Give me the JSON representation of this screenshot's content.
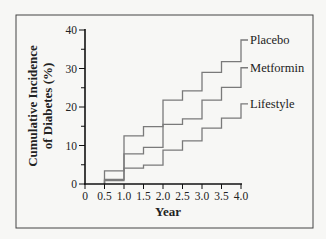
{
  "chart_data": {
    "type": "line",
    "subtype": "step",
    "title": "",
    "xlabel": "Year",
    "ylabel": "Cumulative Incidence of Diabetes (%)",
    "ylabel_lines": [
      "Cumulative Incidence",
      "of Diabetes (%)"
    ],
    "xlim": [
      0,
      4.0
    ],
    "ylim": [
      0,
      40
    ],
    "x_ticks": [
      0,
      0.5,
      1.0,
      1.5,
      2.0,
      2.5,
      3.0,
      3.5,
      4.0
    ],
    "x_tick_labels": [
      "0",
      "0.5",
      "1.0",
      "1.5",
      "2.0",
      "2.5",
      "3.0",
      "3.5",
      "4.0"
    ],
    "y_ticks": [
      0,
      10,
      20,
      30,
      40
    ],
    "y_tick_labels": [
      "0",
      "10",
      "20",
      "30",
      "40"
    ],
    "y_minor_ticks": [
      5,
      15,
      25,
      35
    ],
    "grid": false,
    "legend_position": "inline-right",
    "x": [
      0.5,
      1.0,
      1.5,
      2.0,
      2.5,
      3.0,
      3.5,
      4.0
    ],
    "series": [
      {
        "name": "Placebo",
        "values": [
          3.4,
          12.5,
          14.9,
          21.8,
          24.2,
          29.0,
          31.8,
          37.4
        ]
      },
      {
        "name": "Metformin",
        "values": [
          1.2,
          7.8,
          9.5,
          15.5,
          16.9,
          21.8,
          25.1,
          30.2
        ]
      },
      {
        "name": "Lifestyle",
        "values": [
          0.9,
          4.1,
          4.9,
          8.8,
          11.2,
          14.5,
          17.1,
          20.8
        ]
      }
    ],
    "colors": {
      "series": "#7a7a7a",
      "axis": "#111111",
      "frame": "#444444",
      "background": "#f7f7f5"
    }
  }
}
